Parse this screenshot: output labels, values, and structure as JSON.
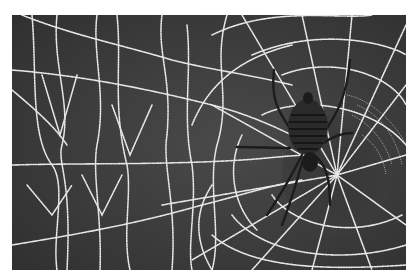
{
  "image": {
    "subject": "Orb-weaver spider on a dew-covered spider web",
    "style": "black-and-white photograph",
    "border_color": "#ffffff",
    "background_color": "#3a3a3a",
    "web_color": "#e6e6e6",
    "spider_color": "#1c1c1c"
  }
}
